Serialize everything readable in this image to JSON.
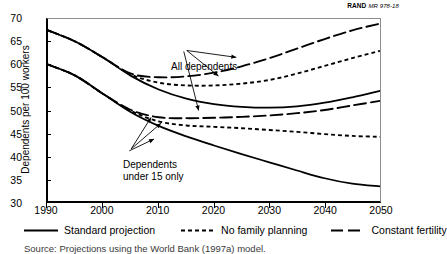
{
  "credit": {
    "publisher": "RAND",
    "document_number": "MR 978-18"
  },
  "source_note": "Source: Projections using the World Bank (1997a) model.",
  "annotations": {
    "upper_group": "All dependents",
    "lower_group_line1": "Dependents",
    "lower_group_line2": "under 15 only"
  },
  "chart_data": {
    "type": "line",
    "title": "",
    "xlabel": "",
    "ylabel": "Dependents per 100 workers",
    "xlim": [
      1990,
      2050
    ],
    "ylim": [
      30,
      70
    ],
    "xticks": [
      1990,
      2000,
      2010,
      2020,
      2030,
      2040,
      2050
    ],
    "yticks": [
      70,
      65,
      60,
      55,
      50,
      45,
      40,
      35,
      30
    ],
    "grid": false,
    "legend_position": "below-axis",
    "legend": [
      {
        "label": "Standard projection",
        "style": "solid"
      },
      {
        "label": "No family planning",
        "style": "dotted"
      },
      {
        "label": "Constant fertility",
        "style": "long-dash"
      }
    ],
    "x": [
      1990,
      1995,
      2000,
      2005,
      2010,
      2015,
      2020,
      2025,
      2030,
      2035,
      2040,
      2045,
      2050
    ],
    "series": [
      {
        "name": "All dependents - Standard projection",
        "group": "All dependents",
        "style": "solid",
        "values": [
          67.5,
          65.0,
          61.5,
          57.5,
          54.5,
          52.5,
          51.3,
          50.7,
          50.5,
          50.8,
          51.6,
          52.8,
          54.2
        ]
      },
      {
        "name": "All dependents - No family planning",
        "group": "All dependents",
        "style": "dotted",
        "values": [
          67.5,
          65.0,
          61.5,
          57.8,
          56.0,
          55.4,
          55.4,
          55.8,
          56.6,
          58.0,
          59.7,
          61.4,
          63.0
        ]
      },
      {
        "name": "All dependents - Constant fertility",
        "group": "All dependents",
        "style": "long-dash",
        "values": [
          67.5,
          65.0,
          61.5,
          58.0,
          57.2,
          57.4,
          58.2,
          59.6,
          61.4,
          63.5,
          65.6,
          67.5,
          69.0
        ]
      },
      {
        "name": "Dependents under 15 only - Standard projection",
        "group": "Dependents under 15 only",
        "style": "solid",
        "values": [
          60.0,
          57.5,
          53.5,
          49.5,
          46.5,
          44.2,
          42.2,
          40.3,
          38.5,
          36.7,
          35.0,
          33.8,
          33.2
        ]
      },
      {
        "name": "Dependents under 15 only - No family planning",
        "group": "Dependents under 15 only",
        "style": "dotted",
        "values": [
          60.0,
          57.5,
          53.5,
          49.8,
          47.5,
          46.6,
          46.3,
          46.0,
          45.6,
          45.2,
          44.7,
          44.3,
          44.1
        ]
      },
      {
        "name": "Dependents under 15 only - Constant fertility",
        "group": "Dependents under 15 only",
        "style": "long-dash",
        "values": [
          60.0,
          57.5,
          53.5,
          50.0,
          48.4,
          48.2,
          48.3,
          48.5,
          48.8,
          49.3,
          50.0,
          51.0,
          52.0
        ]
      }
    ]
  }
}
